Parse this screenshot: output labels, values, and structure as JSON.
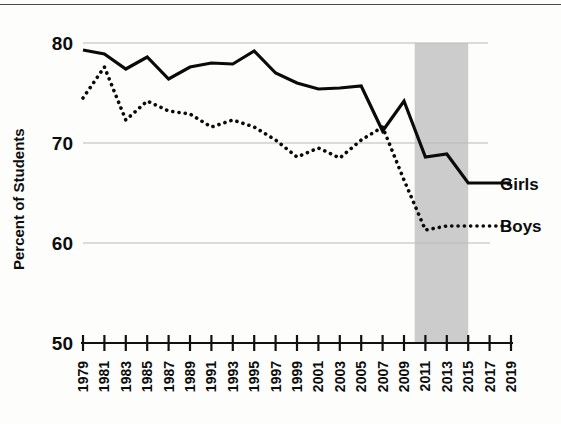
{
  "chart_data": {
    "type": "line",
    "title": "",
    "xlabel": "",
    "ylabel": "Percent of Students",
    "ylim": [
      50,
      80
    ],
    "xlim": [
      1979,
      2019
    ],
    "ytick_labels": [
      "50",
      "60",
      "70",
      "80"
    ],
    "yticks": [
      50,
      60,
      70,
      80
    ],
    "grid": "horizontal gridlines at 60, 70, 80",
    "legend_position": "right, inline at series ends",
    "x": [
      1979,
      1981,
      1983,
      1985,
      1987,
      1989,
      1991,
      1993,
      1995,
      1997,
      1999,
      2001,
      2003,
      2005,
      2007,
      2009,
      2011,
      2013,
      2015,
      2017,
      2019
    ],
    "categories": [
      "1979",
      "1981",
      "1983",
      "1985",
      "1987",
      "1989",
      "1991",
      "1993",
      "1995",
      "1997",
      "1999",
      "2001",
      "2003",
      "2005",
      "2007",
      "2009",
      "2011",
      "2013",
      "2015",
      "2017",
      "2019"
    ],
    "series": [
      {
        "name": "Girls",
        "style": "solid",
        "values": [
          79.3,
          78.9,
          77.4,
          78.6,
          76.4,
          77.6,
          78.0,
          77.9,
          79.2,
          77.0,
          76.0,
          75.4,
          75.5,
          75.7,
          71.2,
          74.2,
          68.6,
          68.9,
          66.0,
          66.0,
          66.0
        ]
      },
      {
        "name": "Boys",
        "style": "dotted",
        "values": [
          74.5,
          77.6,
          72.3,
          74.2,
          73.2,
          72.9,
          71.6,
          72.3,
          71.6,
          70.3,
          68.6,
          69.5,
          68.5,
          70.3,
          71.6,
          66.3,
          61.3,
          61.7,
          61.7,
          61.7,
          61.7
        ]
      }
    ],
    "annotations": [
      {
        "type": "shaded-band",
        "label": "",
        "x_start": 2010,
        "x_end": 2015,
        "color": "#cccccc"
      }
    ]
  },
  "axis": {
    "y_title": "Percent of Students",
    "y_ticks": [
      "80",
      "70",
      "60",
      "50"
    ],
    "x_ticks": [
      "1979",
      "1981",
      "1983",
      "1985",
      "1987",
      "1989",
      "1991",
      "1993",
      "1995",
      "1997",
      "1999",
      "2001",
      "2003",
      "2005",
      "2007",
      "2009",
      "2011",
      "2013",
      "2015",
      "2017",
      "2019"
    ]
  },
  "legend": {
    "girls_label": "Girls",
    "boys_label": "Boys"
  },
  "colors": {
    "line": "#0a0a0a",
    "grid": "#b9b9b9",
    "band": "#cccccc",
    "background": "#fdfdfc"
  }
}
